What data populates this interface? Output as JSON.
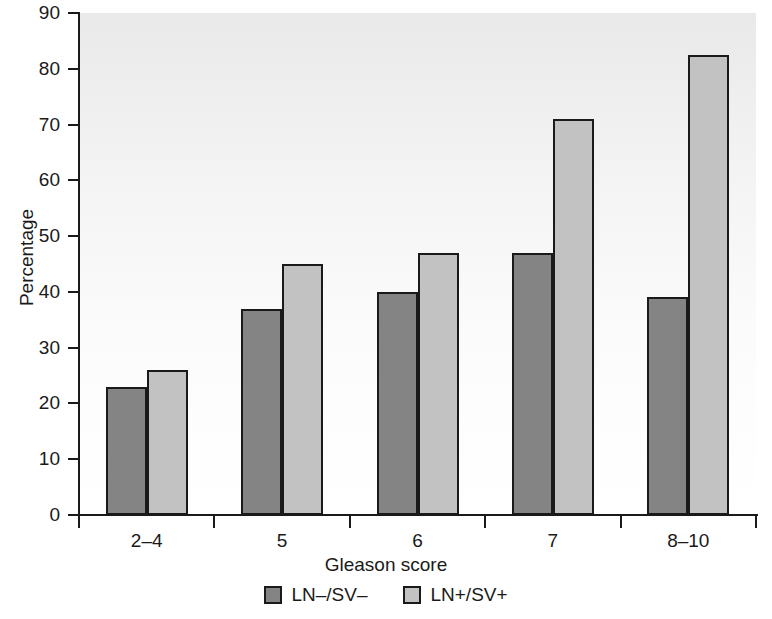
{
  "chart_data": {
    "type": "bar",
    "title": "",
    "xlabel": "Gleason score",
    "ylabel": "Percentage",
    "categories": [
      "2–4",
      "5",
      "6",
      "7",
      "8–10"
    ],
    "series": [
      {
        "name": "LN–/SV–",
        "color": "#848484",
        "values": [
          23,
          37,
          40,
          47,
          39
        ]
      },
      {
        "name": "LN+/SV+",
        "color": "#c2c2c2",
        "values": [
          26,
          45,
          47,
          71,
          82.5
        ]
      }
    ],
    "ylim": [
      0,
      90
    ],
    "ytick_values": [
      0,
      10,
      20,
      30,
      40,
      50,
      60,
      70,
      80,
      90
    ],
    "ytick_labels": [
      "0",
      "10",
      "20",
      "30",
      "40",
      "50",
      "60",
      "70",
      "80",
      "90"
    ],
    "grid": false,
    "legend_position": "bottom-center",
    "bar_edge_color": "#1a1a1a",
    "plot_background_top": "#e9e9e9",
    "plot_background_bottom": "#ffffff"
  }
}
